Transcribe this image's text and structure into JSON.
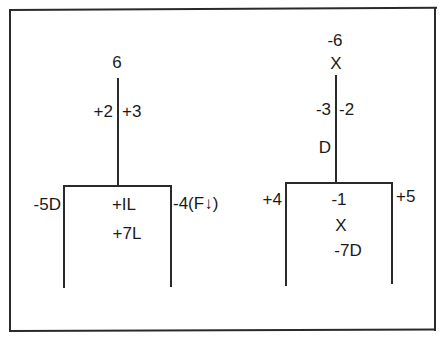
{
  "diagram": {
    "frame": {
      "left": 9,
      "top": 9,
      "right": 436,
      "bottom": 331
    },
    "colors": {
      "ink": "#1a1a1a",
      "line": "#2a2a2a",
      "background": "#ffffff"
    },
    "left_figure": {
      "top_label": "6",
      "stem_left_label": "+2",
      "stem_right_label": "+3",
      "box_left_label": "-5D",
      "box_inner_labels": [
        "+IL",
        "+7L"
      ],
      "box_right_label": "-4(F↓)"
    },
    "right_figure": {
      "top_label": "-6",
      "top_marker": "X",
      "stem_left_label": "-3",
      "stem_right_label": "-2",
      "stem_lower_label": "D",
      "box_left_label": "+4",
      "box_inner_labels": [
        "-1",
        "X",
        "-7D"
      ],
      "box_right_label": "+5"
    }
  }
}
